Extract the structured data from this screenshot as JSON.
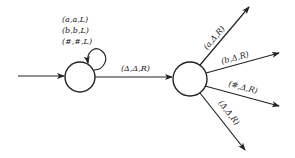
{
  "diagram": {
    "type": "state-transition-diagram",
    "colors": {
      "stroke": "#222222",
      "background": "#ffffff"
    },
    "states": [
      {
        "id": "q1",
        "cx": 80,
        "cy": 77,
        "r": 15
      },
      {
        "id": "q2",
        "cx": 190,
        "cy": 79,
        "r": 17
      }
    ],
    "start_arrow": {
      "to": "q1"
    },
    "self_loop": {
      "state": "q1",
      "labels": [
        "(a,a,L)",
        "(b,b,L)",
        "(#,#,L)"
      ]
    },
    "transitions": [
      {
        "from": "q1",
        "to": "q2",
        "label": "(Δ,Δ,R)"
      },
      {
        "from": "q2",
        "to": "out-a",
        "label": "(a,Δ,R)"
      },
      {
        "from": "q2",
        "to": "out-b",
        "label": "(b,Δ,R)"
      },
      {
        "from": "q2",
        "to": "out-hash",
        "label": "(#,Δ,R)"
      },
      {
        "from": "q2",
        "to": "out-delta",
        "label": "(Δ,Δ,R)"
      }
    ]
  }
}
